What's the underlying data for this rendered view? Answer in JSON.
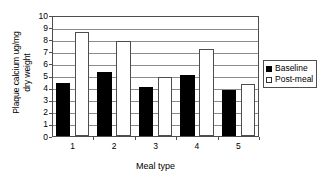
{
  "chart_data": {
    "type": "bar",
    "title": "",
    "subtitle": "",
    "xlabel": "Meal type",
    "ylabel": "Plaque calcium ug/mg\ndry weight",
    "categories": [
      "1",
      "2",
      "3",
      "4",
      "5"
    ],
    "series": [
      {
        "name": "Baseline",
        "color": "#000000",
        "values": [
          4.4,
          5.3,
          4.05,
          5.05,
          3.8
        ]
      },
      {
        "name": "Post-meal",
        "color": "#ffffff",
        "values": [
          8.6,
          7.85,
          4.85,
          7.2,
          4.3
        ]
      }
    ],
    "ylim": [
      0,
      10
    ],
    "ytick_labels": [
      "10",
      "9",
      "8",
      "7",
      "6",
      "5",
      "4",
      "3",
      "2",
      "1",
      "0"
    ],
    "ytick_values": [
      10,
      9,
      8,
      7,
      6,
      5,
      4,
      3,
      2,
      1,
      0
    ],
    "ystep": 1,
    "grid": true,
    "grid_axis": "y",
    "grid_color": "#8c8c8c",
    "axis_color": "#4d4d4d",
    "legend": {
      "position": "right",
      "entries": [
        {
          "label": "Baseline",
          "swatch": "filled"
        },
        {
          "label": "Post-meal",
          "swatch": "hollow"
        }
      ]
    }
  }
}
